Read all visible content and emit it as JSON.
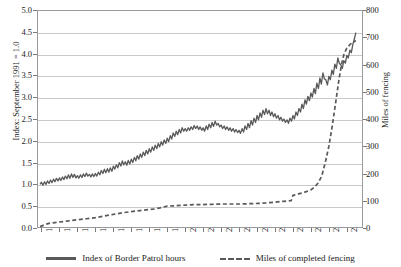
{
  "chart_data": {
    "type": "line",
    "title": "",
    "xlabel": "",
    "ylabel": "Index: September 1991 = 1.0",
    "y2label": "Miles of fencing",
    "grid": true,
    "legend_position": "bottom",
    "xlim": [
      1991.75,
      2009.9
    ],
    "ylim": [
      0.0,
      5.0
    ],
    "y2lim": [
      0,
      800
    ],
    "x_tick_labels": [
      "1992",
      "1993",
      "1994",
      "1995",
      "1996",
      "1997",
      "1998",
      "1999",
      "2000",
      "2001",
      "2002",
      "2003",
      "2004",
      "2005",
      "2006",
      "2007",
      "2008",
      "2009"
    ],
    "y_tick_labels": [
      "0.0",
      "0.5",
      "1.0",
      "1.5",
      "2.0",
      "2.5",
      "3.0",
      "3.5",
      "4.0",
      "4.5",
      "5.0"
    ],
    "y2_tick_labels": [
      "0",
      "100",
      "200",
      "300",
      "400",
      "500",
      "600",
      "700",
      "800"
    ],
    "series": [
      {
        "name": "Index of Border Patrol hours",
        "style": "solid",
        "color": "#595959",
        "axis": "left",
        "x": [
          1991.92,
          1992.0,
          1992.08,
          1992.17,
          1992.25,
          1992.33,
          1992.42,
          1992.5,
          1992.58,
          1992.67,
          1992.75,
          1992.83,
          1992.92,
          1993.0,
          1993.08,
          1993.17,
          1993.25,
          1993.33,
          1993.42,
          1993.5,
          1993.58,
          1993.67,
          1993.75,
          1993.83,
          1993.92,
          1994.0,
          1994.08,
          1994.17,
          1994.25,
          1994.33,
          1994.42,
          1994.5,
          1994.58,
          1994.67,
          1994.75,
          1994.83,
          1994.92,
          1995.0,
          1995.08,
          1995.17,
          1995.25,
          1995.33,
          1995.42,
          1995.5,
          1995.58,
          1995.67,
          1995.75,
          1995.83,
          1995.92,
          1996.0,
          1996.08,
          1996.17,
          1996.25,
          1996.33,
          1996.42,
          1996.5,
          1996.58,
          1996.67,
          1996.75,
          1996.83,
          1996.92,
          1997.0,
          1997.08,
          1997.17,
          1997.25,
          1997.33,
          1997.42,
          1997.5,
          1997.58,
          1997.67,
          1997.75,
          1997.83,
          1997.92,
          1998.0,
          1998.08,
          1998.17,
          1998.25,
          1998.33,
          1998.42,
          1998.5,
          1998.58,
          1998.67,
          1998.75,
          1998.83,
          1998.92,
          1999.0,
          1999.08,
          1999.17,
          1999.25,
          1999.33,
          1999.42,
          1999.5,
          1999.58,
          1999.67,
          1999.75,
          1999.83,
          1999.92,
          2000.0,
          2000.08,
          2000.17,
          2000.25,
          2000.33,
          2000.42,
          2000.5,
          2000.58,
          2000.67,
          2000.75,
          2000.83,
          2000.92,
          2001.0,
          2001.08,
          2001.17,
          2001.25,
          2001.33,
          2001.42,
          2001.5,
          2001.58,
          2001.67,
          2001.75,
          2001.83,
          2001.92,
          2002.0,
          2002.08,
          2002.17,
          2002.25,
          2002.33,
          2002.42,
          2002.5,
          2002.58,
          2002.67,
          2002.75,
          2002.83,
          2002.92,
          2003.0,
          2003.08,
          2003.17,
          2003.25,
          2003.33,
          2003.42,
          2003.5,
          2003.58,
          2003.67,
          2003.75,
          2003.83,
          2003.92,
          2004.0,
          2004.08,
          2004.17,
          2004.25,
          2004.33,
          2004.42,
          2004.5,
          2004.58,
          2004.67,
          2004.75,
          2004.83,
          2004.92,
          2005.0,
          2005.08,
          2005.17,
          2005.25,
          2005.33,
          2005.42,
          2005.5,
          2005.58,
          2005.67,
          2005.75,
          2005.83,
          2005.92,
          2006.0,
          2006.08,
          2006.17,
          2006.25,
          2006.33,
          2006.42,
          2006.5,
          2006.58,
          2006.67,
          2006.75,
          2006.83,
          2006.92,
          2007.0,
          2007.08,
          2007.17,
          2007.25,
          2007.33,
          2007.42,
          2007.5,
          2007.58,
          2007.67,
          2007.75,
          2007.83,
          2007.92,
          2008.0,
          2008.08,
          2008.17,
          2008.25,
          2008.33,
          2008.42,
          2008.5,
          2008.58,
          2008.67,
          2008.75,
          2008.83,
          2008.92,
          2009.0,
          2009.08,
          2009.17,
          2009.25,
          2009.33,
          2009.42,
          2009.5
        ],
        "values": [
          1.0,
          1.05,
          0.98,
          1.06,
          1.0,
          1.08,
          1.02,
          1.1,
          1.04,
          1.12,
          1.06,
          1.14,
          1.08,
          1.15,
          1.09,
          1.17,
          1.11,
          1.19,
          1.13,
          1.22,
          1.14,
          1.24,
          1.16,
          1.23,
          1.15,
          1.2,
          1.14,
          1.22,
          1.16,
          1.24,
          1.18,
          1.26,
          1.19,
          1.23,
          1.17,
          1.24,
          1.18,
          1.25,
          1.19,
          1.28,
          1.22,
          1.32,
          1.25,
          1.35,
          1.27,
          1.36,
          1.28,
          1.38,
          1.3,
          1.42,
          1.35,
          1.45,
          1.38,
          1.5,
          1.42,
          1.54,
          1.45,
          1.52,
          1.44,
          1.55,
          1.47,
          1.58,
          1.5,
          1.62,
          1.54,
          1.66,
          1.58,
          1.7,
          1.62,
          1.74,
          1.66,
          1.78,
          1.7,
          1.82,
          1.74,
          1.86,
          1.78,
          1.9,
          1.82,
          1.94,
          1.86,
          1.98,
          1.9,
          2.02,
          1.94,
          2.06,
          1.98,
          2.12,
          2.04,
          2.18,
          2.1,
          2.22,
          2.14,
          2.26,
          2.18,
          2.3,
          2.22,
          2.28,
          2.22,
          2.3,
          2.24,
          2.32,
          2.26,
          2.35,
          2.28,
          2.34,
          2.26,
          2.32,
          2.24,
          2.3,
          2.22,
          2.34,
          2.26,
          2.38,
          2.3,
          2.42,
          2.33,
          2.45,
          2.36,
          2.4,
          2.32,
          2.36,
          2.28,
          2.34,
          2.26,
          2.32,
          2.24,
          2.3,
          2.22,
          2.28,
          2.2,
          2.26,
          2.19,
          2.24,
          2.17,
          2.28,
          2.2,
          2.34,
          2.26,
          2.4,
          2.3,
          2.46,
          2.36,
          2.52,
          2.42,
          2.58,
          2.48,
          2.64,
          2.54,
          2.7,
          2.6,
          2.74,
          2.62,
          2.7,
          2.58,
          2.66,
          2.55,
          2.62,
          2.52,
          2.58,
          2.48,
          2.54,
          2.45,
          2.5,
          2.42,
          2.48,
          2.4,
          2.52,
          2.45,
          2.58,
          2.5,
          2.66,
          2.58,
          2.74,
          2.66,
          2.84,
          2.74,
          2.94,
          2.84,
          3.02,
          2.92,
          3.1,
          3.0,
          3.2,
          3.08,
          3.32,
          3.2,
          3.44,
          3.3,
          3.56,
          3.42,
          3.4,
          3.28,
          3.48,
          3.4,
          3.62,
          3.52,
          3.76,
          3.66,
          3.9,
          3.78,
          3.74,
          3.66,
          3.84,
          3.78,
          3.96,
          3.9,
          4.08,
          4.02,
          4.2,
          4.34,
          4.48
        ],
        "start_value": 1.0,
        "end_value": 4.48,
        "peak_value": 4.48
      },
      {
        "name": "Miles of completed fencing",
        "style": "dashed",
        "color": "#595959",
        "axis": "right",
        "x": [
          1991.92,
          1992.25,
          1992.5,
          1992.75,
          1993.0,
          1993.5,
          1994.0,
          1994.5,
          1995.0,
          1995.5,
          1996.0,
          1996.5,
          1997.0,
          1997.5,
          1998.0,
          1998.35,
          1998.45,
          1998.6,
          1999.0,
          1999.5,
          2000.0,
          2000.5,
          2001.0,
          2001.5,
          2002.0,
          2002.5,
          2003.0,
          2003.5,
          2004.0,
          2004.5,
          2005.0,
          2005.5,
          2005.9,
          2006.0,
          2006.15,
          2006.3,
          2006.6,
          2007.0,
          2007.2,
          2007.4,
          2007.6,
          2007.8,
          2008.0,
          2008.2,
          2008.4,
          2008.55,
          2008.7,
          2008.85,
          2009.0,
          2009.2,
          2009.5
        ],
        "values": [
          5,
          14,
          18,
          20,
          22,
          26,
          30,
          34,
          38,
          44,
          50,
          56,
          60,
          64,
          68,
          70,
          72,
          74,
          80,
          82,
          84,
          86,
          86,
          87,
          88,
          88,
          88,
          89,
          90,
          92,
          95,
          98,
          100,
          120,
          122,
          125,
          130,
          140,
          150,
          165,
          190,
          240,
          300,
          380,
          470,
          540,
          600,
          640,
          660,
          675,
          688
        ],
        "start_value": 5,
        "end_value": 688
      }
    ]
  },
  "axes": {
    "left_label": "Index: September 1991 = 1.0",
    "right_label": "Miles of fencing"
  },
  "legend": {
    "items": [
      {
        "label": "Index of Border Patrol hours",
        "style": "solid"
      },
      {
        "label": "Miles of completed fencing",
        "style": "dashed"
      }
    ]
  }
}
